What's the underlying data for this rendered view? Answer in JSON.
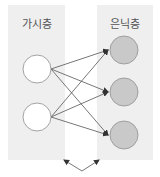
{
  "diagram": {
    "visible_layer": {
      "label": "가시층",
      "node_count": 2,
      "node_fill": "#ffffff",
      "panel_color": "#efefef"
    },
    "hidden_layer": {
      "label": "은닉층",
      "node_count": 3,
      "node_fill": "#c9c9c9",
      "panel_color": "#efefef"
    },
    "connections": "fully connected (each visible node to each hidden node)",
    "edge_color": "#555555",
    "bottom_annotation": "double arrow pointing up to both layers"
  }
}
